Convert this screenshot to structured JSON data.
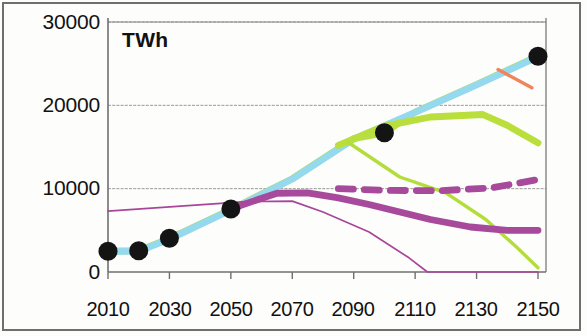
{
  "chart_data": {
    "type": "line",
    "title": "",
    "subtitle": "",
    "unit_label": "TWh",
    "xlabel": "",
    "ylabel": "TWh",
    "xlim": [
      2010,
      2150
    ],
    "ylim": [
      0,
      30000
    ],
    "x_ticks": [
      2010,
      2030,
      2050,
      2070,
      2090,
      2110,
      2130,
      2150
    ],
    "x_tick_labels": [
      "2010",
      "2030",
      "2050",
      "2070",
      "2090",
      "2110",
      "2130",
      "2150"
    ],
    "y_ticks": [
      0,
      10000,
      20000,
      30000
    ],
    "y_tick_labels": [
      "0",
      "10000",
      "20000",
      "30000"
    ],
    "grid": true,
    "legend": "none",
    "colors": {
      "bright_green": "#b5e241",
      "light_blue": "#95d9ee",
      "mid_green": "#bade3c",
      "thin_green": "#b4dd3b",
      "thick_purple": "#a84a9c",
      "dashed_purple": "#a84a9c",
      "thin_purple": "#a8469a",
      "orange": "#f0845a",
      "marker_black": "#141414",
      "axis": "#6f6f6f",
      "grid_line": "#8a8a8a"
    },
    "series": [
      {
        "name": "total-demand-bright-green",
        "style": "solid",
        "width": "thick",
        "color": "#b5e241",
        "points": [
          [
            2010,
            2500
          ],
          [
            2020,
            2550
          ],
          [
            2030,
            4000
          ],
          [
            2050,
            7500
          ],
          [
            2070,
            11200
          ],
          [
            2090,
            16000
          ],
          [
            2100,
            16700
          ],
          [
            2110,
            19200
          ],
          [
            2130,
            22500
          ],
          [
            2150,
            25900
          ]
        ]
      },
      {
        "name": "total-demand-light-blue",
        "style": "solid",
        "width": "thick",
        "color": "#95d9ee",
        "points": [
          [
            2010,
            2450
          ],
          [
            2020,
            2500
          ],
          [
            2030,
            3950
          ],
          [
            2050,
            7450
          ],
          [
            2070,
            11150
          ],
          [
            2090,
            15950
          ],
          [
            2110,
            19150
          ],
          [
            2130,
            22450
          ],
          [
            2150,
            25850
          ]
        ]
      },
      {
        "name": "branch-green-plateau",
        "style": "solid",
        "width": "thick",
        "color": "#bade3c",
        "points": [
          [
            2085,
            15200
          ],
          [
            2100,
            17500
          ],
          [
            2115,
            18600
          ],
          [
            2132,
            18900
          ],
          [
            2140,
            17600
          ],
          [
            2150,
            15500
          ]
        ]
      },
      {
        "name": "branch-green-decline",
        "style": "solid",
        "width": "medium",
        "color": "#b4dd3b",
        "points": [
          [
            2088,
            15600
          ],
          [
            2105,
            11400
          ],
          [
            2120,
            9500
          ],
          [
            2133,
            6300
          ],
          [
            2143,
            3000
          ],
          [
            2150,
            500
          ]
        ]
      },
      {
        "name": "fossil-thick-purple",
        "style": "solid",
        "width": "thick",
        "color": "#a84a9c",
        "points": [
          [
            2050,
            7600
          ],
          [
            2065,
            9450
          ],
          [
            2075,
            9500
          ],
          [
            2085,
            8900
          ],
          [
            2095,
            8100
          ],
          [
            2115,
            6300
          ],
          [
            2128,
            5400
          ],
          [
            2140,
            5000
          ],
          [
            2150,
            5000
          ]
        ]
      },
      {
        "name": "fossil-dashed-purple",
        "style": "dashed",
        "width": "thick",
        "color": "#a84a9c",
        "points": [
          [
            2085,
            10000
          ],
          [
            2100,
            9800
          ],
          [
            2118,
            9750
          ],
          [
            2135,
            10100
          ],
          [
            2150,
            11100
          ]
        ]
      },
      {
        "name": "fossil-thin-purple",
        "style": "solid",
        "width": "thin",
        "color": "#a8469a",
        "points": [
          [
            2010,
            7300
          ],
          [
            2055,
            8450
          ],
          [
            2070,
            8500
          ],
          [
            2080,
            7200
          ],
          [
            2095,
            4800
          ],
          [
            2108,
            1700
          ],
          [
            2114,
            0
          ],
          [
            2150,
            0
          ]
        ]
      },
      {
        "name": "orange-marker-segment",
        "style": "solid",
        "width": "medium",
        "color": "#f0845a",
        "points": [
          [
            2137,
            24300
          ],
          [
            2148,
            22100
          ]
        ]
      }
    ],
    "markers": [
      {
        "x": 2010,
        "y": 2500,
        "color": "#141414"
      },
      {
        "x": 2020,
        "y": 2550,
        "color": "#141414"
      },
      {
        "x": 2030,
        "y": 4050,
        "color": "#141414"
      },
      {
        "x": 2050,
        "y": 7550,
        "color": "#141414"
      },
      {
        "x": 2100,
        "y": 16700,
        "color": "#141414"
      },
      {
        "x": 2150,
        "y": 25900,
        "color": "#141414"
      }
    ]
  },
  "axis_labels": {
    "y": [
      {
        "value": "30000",
        "top": 10
      },
      {
        "value": "20000",
        "top": 93
      },
      {
        "value": "10000",
        "top": 176
      },
      {
        "value": "0",
        "top": 260
      }
    ],
    "x": [
      {
        "value": "2010",
        "left": 108
      },
      {
        "value": "2030",
        "left": 170
      },
      {
        "value": "2050",
        "left": 231
      },
      {
        "value": "2070",
        "left": 292
      },
      {
        "value": "2090",
        "left": 353
      },
      {
        "value": "2110",
        "left": 415
      },
      {
        "value": "2130",
        "left": 476
      },
      {
        "value": "2150",
        "left": 538
      }
    ]
  }
}
